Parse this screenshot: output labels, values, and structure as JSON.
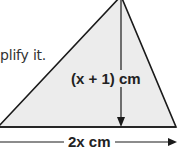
{
  "text_snippet": "plify it.",
  "diagram": {
    "shape": "triangle",
    "fill_color": "#ececec",
    "stroke_color": "#1a1a1a",
    "height_label": "(x + 1) cm",
    "base_label": "2x cm"
  }
}
